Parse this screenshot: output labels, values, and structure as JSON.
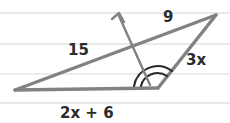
{
  "figure": {
    "background_color": "#ffffff",
    "stroke_color": "#808080",
    "arc_color": "#2b2b2b",
    "text_color": "#2b2b2b",
    "rule_line_color": "#e8e8e8"
  },
  "ruled_lines": {
    "name": "notebook-rule-lines",
    "count": 4,
    "y_positions": [
      13,
      44,
      74,
      103
    ]
  },
  "triangle": {
    "name": "triangle-shape",
    "vertices": {
      "left": {
        "label": "left-vertex",
        "x": 15,
        "y": 90
      },
      "apex": {
        "label": "apex-vertex",
        "x": 216,
        "y": 15
      },
      "bottom_right": {
        "label": "bottom-right-vertex",
        "x": 158,
        "y": 88
      }
    },
    "sides": [
      {
        "name": "side-15",
        "from": "left",
        "to": "apex",
        "label": "15"
      },
      {
        "name": "side-9",
        "from": "apex",
        "to": "bottom_right",
        "label": "9"
      },
      {
        "name": "side-3x",
        "from": "bottom_right",
        "to": "apex",
        "label": "3x"
      },
      {
        "name": "side-2x-plus-6",
        "from": "left",
        "to": "bottom_right",
        "label": "2x + 6"
      }
    ]
  },
  "labels": {
    "side_15": {
      "text": "15",
      "x": 68,
      "y": 55
    },
    "side_9": {
      "text": "9",
      "x": 165,
      "y": 22
    },
    "side_3x": {
      "text": "3x",
      "x": 193,
      "y": 65
    },
    "base_2x_plus_6": {
      "text": "2x + 6",
      "x": 85,
      "y": 117
    }
  },
  "ray": {
    "name": "angle-bisector-ray",
    "from_x": 150,
    "from_y": 85,
    "to_x": 119,
    "to_y": 16,
    "has_arrowhead": true
  },
  "angle_arcs": [
    {
      "name": "angle-arc-outer",
      "radius": 24,
      "description": "large arc at bottom-right vertex spanning base to side"
    },
    {
      "name": "angle-arc-inner",
      "radius": 17,
      "description": "smaller arc at bottom-right vertex"
    }
  ]
}
